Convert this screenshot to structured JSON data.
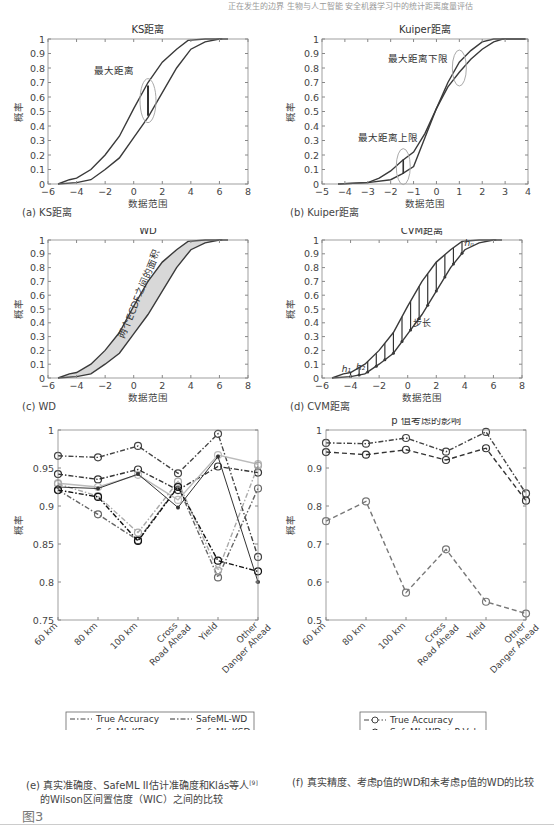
{
  "header": {
    "running_text": "正在发生的边界 生物与人工智能 安全机器学习中的统计距离度量评估"
  },
  "figure_label": "图3",
  "captions": {
    "a": "(a) KS距离",
    "b": "(b) Kuiper距离",
    "c": "(c) WD",
    "d": "(d) CVM距离",
    "e_line1": "(e) 真实准确度、SafeML II估计准确度和Klás等人",
    "e_ref": "[9]",
    "e_line2": "的Wilson区间置信度（WIC）之间的比较",
    "f": "(f) 真实精度、考虑p值的WD和未考虑p值的WD的比较"
  },
  "chart_data": [
    {
      "id": "a",
      "type": "line",
      "title": "KS距离",
      "xlabel": "数据范围",
      "ylabel": "概率",
      "xlim": [
        -6,
        8
      ],
      "ylim": [
        0,
        1
      ],
      "xticks": [
        -6,
        -4,
        -2,
        0,
        2,
        4,
        6,
        8
      ],
      "yticks": [
        0,
        0.1,
        0.2,
        0.3,
        0.4,
        0.5,
        0.6,
        0.7,
        0.8,
        0.9,
        1
      ],
      "annotations": [
        {
          "text": "最大距离",
          "x": 1,
          "y_top": 0.68,
          "y_bottom": 0.47
        }
      ],
      "series": [
        {
          "name": "ECDF 1",
          "x": [
            -5.3,
            -4.5,
            -4,
            -3,
            -2,
            -1,
            0,
            1,
            2,
            3,
            3.8,
            5,
            6.2
          ],
          "y": [
            0,
            0.03,
            0.04,
            0.1,
            0.2,
            0.33,
            0.52,
            0.7,
            0.84,
            0.93,
            0.99,
            1,
            1
          ]
        },
        {
          "name": "ECDF 2",
          "x": [
            -5.3,
            -4,
            -3,
            -2,
            -1,
            0,
            1,
            2,
            3,
            4,
            5,
            6,
            6.6
          ],
          "y": [
            0,
            0.01,
            0.03,
            0.1,
            0.18,
            0.32,
            0.46,
            0.63,
            0.8,
            0.93,
            0.98,
            1,
            1
          ]
        }
      ]
    },
    {
      "id": "b",
      "type": "line",
      "title": "Kuiper距离",
      "xlabel": "数据范围",
      "ylabel": "概率",
      "xlim": [
        -5,
        4
      ],
      "ylim": [
        0,
        1
      ],
      "xticks": [
        -5,
        -4,
        -3,
        -2,
        -1,
        0,
        1,
        2,
        3,
        4
      ],
      "yticks": [
        0,
        0.1,
        0.2,
        0.3,
        0.4,
        0.5,
        0.6,
        0.7,
        0.8,
        0.9,
        1
      ],
      "annotations": [
        {
          "text": "最大距离下限",
          "x": 1,
          "y": 0.8
        },
        {
          "text": "最大距离上限",
          "x": -1.45,
          "y_top": 0.17,
          "y_bottom": 0.07
        }
      ],
      "series": [
        {
          "name": "ECDF 1",
          "x": [
            -4.3,
            -3,
            -2.5,
            -2,
            -1.5,
            -1,
            -0.5,
            0,
            0.5,
            1,
            1.5,
            2,
            2.5,
            3.9
          ],
          "y": [
            0,
            0.01,
            0.04,
            0.09,
            0.16,
            0.22,
            0.35,
            0.52,
            0.7,
            0.84,
            0.92,
            0.98,
            1,
            1
          ]
        },
        {
          "name": "ECDF 2",
          "x": [
            -4.3,
            -3,
            -2,
            -1.5,
            -1,
            -0.5,
            0,
            0.5,
            1,
            1.5,
            2,
            2.5,
            2.9,
            3.9
          ],
          "y": [
            0,
            0.01,
            0.03,
            0.07,
            0.12,
            0.32,
            0.52,
            0.67,
            0.77,
            0.86,
            0.93,
            0.98,
            1,
            1
          ]
        }
      ]
    },
    {
      "id": "c",
      "type": "area",
      "title": "WD",
      "xlabel": "数据范围",
      "ylabel": "概率",
      "xlim": [
        -6,
        8
      ],
      "ylim": [
        0,
        1
      ],
      "xticks": [
        -6,
        -4,
        -2,
        0,
        2,
        4,
        6,
        8
      ],
      "yticks": [
        0,
        0.1,
        0.2,
        0.3,
        0.4,
        0.5,
        0.6,
        0.7,
        0.8,
        0.9,
        1
      ],
      "annotations": [
        {
          "text": "两个ECDF之间的面积",
          "rotated": true
        }
      ],
      "series": [
        {
          "name": "ECDF 1",
          "x": [
            -5.3,
            -4.5,
            -4,
            -3,
            -2,
            -1,
            0,
            1,
            2,
            3,
            3.8,
            5,
            6.2
          ],
          "y": [
            0,
            0.03,
            0.04,
            0.1,
            0.2,
            0.33,
            0.52,
            0.7,
            0.84,
            0.93,
            0.99,
            1,
            1
          ]
        },
        {
          "name": "ECDF 2",
          "x": [
            -5.3,
            -4,
            -3,
            -2,
            -1,
            0,
            1,
            2,
            3,
            4,
            5,
            6,
            6.6
          ],
          "y": [
            0,
            0.01,
            0.03,
            0.1,
            0.18,
            0.32,
            0.46,
            0.63,
            0.8,
            0.93,
            0.98,
            1,
            1
          ]
        }
      ]
    },
    {
      "id": "d",
      "type": "line",
      "title": "CVM距离",
      "xlabel": "数据范围",
      "ylabel": "概率",
      "xlim": [
        -6,
        8
      ],
      "ylim": [
        0,
        1
      ],
      "xticks": [
        -6,
        -4,
        -2,
        0,
        2,
        4,
        6,
        8
      ],
      "yticks": [
        0,
        0.1,
        0.2,
        0.3,
        0.4,
        0.5,
        0.6,
        0.7,
        0.8,
        0.9,
        1
      ],
      "annotations": [
        {
          "text": "h1",
          "x": -4.3,
          "y": 0.04
        },
        {
          "text": "h2",
          "x": -3.3,
          "y": 0.06
        },
        {
          "text": "hn",
          "x": 4.3,
          "y": 0.96
        },
        {
          "text": "步长",
          "x": 1,
          "y": 0.38
        }
      ],
      "series": [
        {
          "name": "ECDF 1",
          "x": [
            -5.3,
            -4.5,
            -4,
            -3,
            -2,
            -1,
            0,
            1,
            2,
            3,
            3.8,
            5,
            6.2
          ],
          "y": [
            0,
            0.03,
            0.04,
            0.1,
            0.2,
            0.33,
            0.52,
            0.7,
            0.84,
            0.93,
            0.99,
            1,
            1
          ]
        },
        {
          "name": "ECDF 2",
          "x": [
            -5.3,
            -4,
            -3,
            -2,
            -1,
            0,
            1,
            2,
            3,
            4,
            5,
            6,
            6.6
          ],
          "y": [
            0,
            0.01,
            0.03,
            0.1,
            0.18,
            0.32,
            0.46,
            0.63,
            0.8,
            0.93,
            0.98,
            1,
            1
          ]
        }
      ]
    },
    {
      "id": "e",
      "type": "line",
      "title": "",
      "xlabel": "",
      "ylabel": "概率",
      "ylim": [
        0.75,
        1
      ],
      "yticks": [
        0.75,
        0.8,
        0.85,
        0.9,
        0.95,
        1
      ],
      "categories": [
        "60 km",
        "80 km",
        "100 km",
        "Cross Road Ahead",
        "Yield",
        "Other Danger Ahead"
      ],
      "legend_position": "below",
      "series": [
        {
          "name": "True Accuracy",
          "values": [
            0.966,
            0.964,
            0.979,
            0.943,
            0.995,
            0.833
          ],
          "style": "dash-dot",
          "color": "#444444"
        },
        {
          "name": "SafeML-WD",
          "values": [
            0.942,
            0.935,
            0.948,
            0.921,
            0.952,
            0.944
          ],
          "style": "dash-dot",
          "color": "#333333"
        },
        {
          "name": "SafeML-KD",
          "values": [
            0.93,
            0.925,
            0.941,
            0.908,
            0.967,
            0.955
          ],
          "style": "solid",
          "color": "#bbbbbb"
        },
        {
          "name": "SafeML-KSD",
          "values": [
            0.921,
            0.889,
            0.855,
            0.926,
            0.806,
            0.923
          ],
          "style": "dash-dot",
          "color": "#666666"
        },
        {
          "name": "SafeML-ADD",
          "values": [
            0.929,
            0.913,
            0.865,
            0.932,
            0.815,
            0.953
          ],
          "style": "dash-dot",
          "color": "#aaaaaa"
        },
        {
          "name": "SafeML-CVMD",
          "values": [
            0.921,
            0.912,
            0.854,
            0.925,
            0.828,
            0.814
          ],
          "style": "dash-dot",
          "color": "#111111"
        },
        {
          "name": "WIC Lower Band",
          "values": [
            0.925,
            0.923,
            0.942,
            0.898,
            0.965,
            0.8
          ],
          "style": "marker",
          "color": "#333333"
        }
      ]
    },
    {
      "id": "f",
      "type": "line",
      "title": "p 值考虑的影响",
      "xlabel": "",
      "ylabel": "概率",
      "ylim": [
        0.5,
        1
      ],
      "yticks": [
        0.5,
        0.6,
        0.7,
        0.8,
        0.9,
        1
      ],
      "categories": [
        "60 km",
        "80 km",
        "100 km",
        "Cross Road Ahead",
        "Yield",
        "Other Danger Ahead"
      ],
      "legend_position": "below",
      "series": [
        {
          "name": "True Accuracy",
          "values": [
            0.966,
            0.964,
            0.979,
            0.943,
            0.995,
            0.833
          ],
          "style": "dash-dot",
          "color": "#444444"
        },
        {
          "name": "SafeML-WD + P-Value",
          "values": [
            0.942,
            0.935,
            0.948,
            0.921,
            0.952,
            0.814
          ],
          "style": "dashed",
          "color": "#333333"
        },
        {
          "name": "SafeML-WD",
          "values": [
            0.76,
            0.812,
            0.572,
            0.686,
            0.548,
            0.517
          ],
          "style": "dashed",
          "color": "#777777"
        }
      ]
    }
  ],
  "legends": {
    "e": [
      {
        "label": "True Accuracy",
        "col": 0
      },
      {
        "label": "SafeML-WD",
        "col": 1
      },
      {
        "label": "SafeML-KD",
        "col": 0
      },
      {
        "label": "SafeML-KSD",
        "col": 1
      },
      {
        "label": "SafeML-ADD",
        "col": 0
      },
      {
        "label": "SafeML-CVMD",
        "col": 1
      },
      {
        "label": "WIC Lower Band",
        "col": 0
      }
    ],
    "f": [
      {
        "label": "True Accuracy"
      },
      {
        "label": "SafeML-WD + P-Value"
      },
      {
        "label": "SafeML-WD"
      }
    ]
  }
}
